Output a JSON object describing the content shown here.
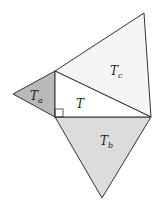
{
  "diagram": {
    "colors": {
      "stroke": "#333333",
      "T": "#ffffff",
      "Ta": "#b9b9b9",
      "Tb": "#dcdcdc",
      "Tc": "#f5f5f5"
    },
    "shapes": [
      {
        "id": "T",
        "label": "T",
        "subscript": "",
        "points": "55,71 151,117 55,117"
      },
      {
        "id": "Ta",
        "label": "T",
        "subscript": "a",
        "points": "55,71 55,117 13,94"
      },
      {
        "id": "Tb",
        "label": "T",
        "subscript": "b",
        "points": "55,117 151,117 102,198"
      },
      {
        "id": "Tc",
        "label": "T",
        "subscript": "c",
        "points": "55,71 144,13 151,117"
      }
    ],
    "labels": {
      "T": {
        "text": "T",
        "sub": ""
      },
      "Ta": {
        "text": "T",
        "sub": "a"
      },
      "Tb": {
        "text": "T",
        "sub": "b"
      },
      "Tc": {
        "text": "T",
        "sub": "c"
      }
    },
    "right_angle_marker": {
      "x": 55,
      "y": 109,
      "size": 8
    }
  }
}
